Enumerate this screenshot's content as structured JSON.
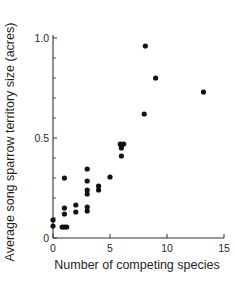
{
  "chart_data": {
    "type": "scatter",
    "title": "",
    "xlabel": "Number of competing species",
    "ylabel": "Average song sparrow territory size (acres)",
    "xlim": [
      0,
      15
    ],
    "ylim": [
      0,
      1.0
    ],
    "x_ticks": [
      0,
      5,
      10,
      15
    ],
    "x_tick_labels": [
      "0",
      "5",
      "10",
      "15"
    ],
    "y_ticks": [
      0,
      0.5,
      1.0
    ],
    "y_tick_labels": [
      "0",
      "0.5",
      "1.0"
    ],
    "y_minor_ticks": [
      0.1,
      0.2,
      0.3,
      0.4,
      0.6,
      0.7,
      0.8,
      0.9
    ],
    "grid": false,
    "legend": null,
    "marker_color": "#111111",
    "series": [
      {
        "name": "sites",
        "points": [
          {
            "x": 0,
            "y": 0.09
          },
          {
            "x": 0,
            "y": 0.06
          },
          {
            "x": 0.8,
            "y": 0.055
          },
          {
            "x": 1.0,
            "y": 0.055
          },
          {
            "x": 1.2,
            "y": 0.055
          },
          {
            "x": 1,
            "y": 0.12
          },
          {
            "x": 1,
            "y": 0.15
          },
          {
            "x": 1,
            "y": 0.3
          },
          {
            "x": 2,
            "y": 0.13
          },
          {
            "x": 2,
            "y": 0.165
          },
          {
            "x": 3,
            "y": 0.135
          },
          {
            "x": 3,
            "y": 0.155
          },
          {
            "x": 3,
            "y": 0.22
          },
          {
            "x": 3,
            "y": 0.24
          },
          {
            "x": 3,
            "y": 0.285
          },
          {
            "x": 3,
            "y": 0.345
          },
          {
            "x": 4,
            "y": 0.24
          },
          {
            "x": 4,
            "y": 0.26
          },
          {
            "x": 5,
            "y": 0.305
          },
          {
            "x": 6,
            "y": 0.41
          },
          {
            "x": 6,
            "y": 0.45
          },
          {
            "x": 6,
            "y": 0.46
          },
          {
            "x": 5.9,
            "y": 0.47
          },
          {
            "x": 6.2,
            "y": 0.47
          },
          {
            "x": 8,
            "y": 0.62
          },
          {
            "x": 8.1,
            "y": 0.96
          },
          {
            "x": 9,
            "y": 0.8
          },
          {
            "x": 13.2,
            "y": 0.73
          }
        ]
      }
    ]
  }
}
